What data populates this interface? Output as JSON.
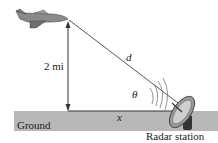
{
  "diagram": {
    "labels": {
      "height": "2 mi",
      "distance": "d",
      "angle": "θ",
      "horizontal": "x",
      "ground": "Ground",
      "station": "Radar station"
    },
    "icons": [
      "airplane-icon",
      "radar-dish-icon"
    ],
    "colors": {
      "ground": "#b4b4b4",
      "line": "#333333",
      "background": "#ffffff"
    }
  }
}
